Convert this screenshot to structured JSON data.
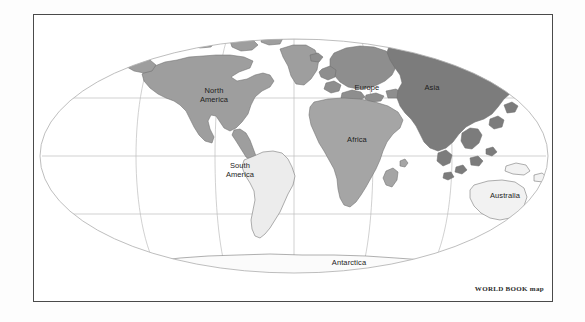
{
  "map": {
    "title": "World map",
    "projection": "elliptical (Mollweide-style) world projection",
    "credit": "WORLD BOOK map",
    "background_color": "#ffffff",
    "frame_color": "#4a4a4a",
    "graticule_color": "#b9b9b9",
    "coastline_color": "#6e6e6e",
    "label_color": "#1c1c1c",
    "continents": [
      {
        "id": "north-america",
        "label": "North\nAmerica",
        "fill": "#9e9e9e",
        "label_x": 180,
        "label_y": 80
      },
      {
        "id": "south-america",
        "label": "South\nAmerica",
        "fill": "#ececec",
        "label_x": 206,
        "label_y": 154
      },
      {
        "id": "europe",
        "label": "Europe",
        "fill": "#8e8e8e",
        "label_x": 333,
        "label_y": 74
      },
      {
        "id": "africa",
        "label": "Africa",
        "fill": "#a5a5a5",
        "label_x": 323,
        "label_y": 126
      },
      {
        "id": "asia",
        "label": "Asia",
        "fill": "#7c7c7c",
        "label_x": 398,
        "label_y": 85
      },
      {
        "id": "australia",
        "label": "Australia",
        "fill": "#f2f2f2",
        "label_x": 471,
        "label_y": 192
      },
      {
        "id": "antarctica",
        "label": "Antarctica",
        "fill": "#fbfbfb",
        "label_x": 314,
        "label_y": 262
      }
    ],
    "graticule": {
      "parallels": [
        "75N",
        "45N",
        "15N",
        "15S",
        "45S",
        "75S"
      ],
      "meridians": [
        "120W",
        "60W",
        "0",
        "60E",
        "120E"
      ]
    }
  }
}
